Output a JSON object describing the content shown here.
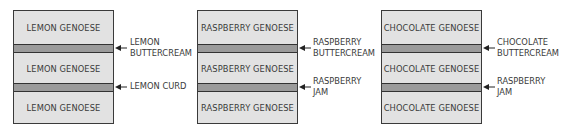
{
  "cakes": [
    {
      "layers": [
        "LEMON GENOESE",
        "LEMON GENOESE",
        "LEMON GENOESE"
      ],
      "fillings": [
        {
          "line1": "LEMON",
          "line2": "BUTTERCREAM"
        },
        {
          "line1": "LEMON CURD",
          "line2": ""
        }
      ]
    },
    {
      "layers": [
        "RASPBERRY GENOESE",
        "RASPBERRY GENOESE",
        "RASPBERRY GENOESE"
      ],
      "fillings": [
        {
          "line1": "RASPBERRY",
          "line2": "BUTTERCREAM"
        },
        {
          "line1": "RASPBERRY",
          "line2": "JAM"
        }
      ]
    },
    {
      "layers": [
        "CHOCOLATE GENOESE",
        "CHOCOLATE GENOESE",
        "CHOCOLATE GENOESE"
      ],
      "fillings": [
        {
          "line1": "CHOCOLATE",
          "line2": "BUTTERCREAM"
        },
        {
          "line1": "RASPBERRY",
          "line2": "JAM"
        }
      ]
    }
  ],
  "colors": {
    "sponge": "#e2e2e2",
    "filling": "#9b9b9b",
    "outline": "#3a3a3a"
  }
}
